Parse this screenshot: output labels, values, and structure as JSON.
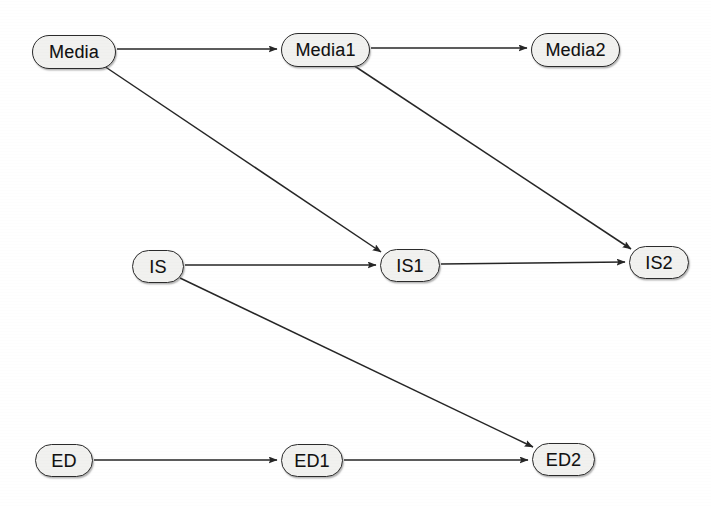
{
  "diagram": {
    "background_color": "#ffffff",
    "node_fill_color": "#f1f1ef",
    "node_stroke_color": "#2b2b2b",
    "edge_color": "#262626",
    "nodes": [
      {
        "id": "media",
        "label": "Media",
        "x": 32,
        "y": 35,
        "w": 84,
        "h": 34
      },
      {
        "id": "media1",
        "label": "Media1",
        "x": 281,
        "y": 33,
        "w": 89,
        "h": 34
      },
      {
        "id": "media2",
        "label": "Media2",
        "x": 531,
        "y": 33,
        "w": 89,
        "h": 34
      },
      {
        "id": "is",
        "label": "IS",
        "x": 132,
        "y": 250,
        "w": 52,
        "h": 33
      },
      {
        "id": "is1",
        "label": "IS1",
        "x": 380,
        "y": 249,
        "w": 60,
        "h": 33
      },
      {
        "id": "is2",
        "label": "IS2",
        "x": 629,
        "y": 246,
        "w": 60,
        "h": 33
      },
      {
        "id": "ed",
        "label": "ED",
        "x": 35,
        "y": 444,
        "w": 58,
        "h": 33
      },
      {
        "id": "ed1",
        "label": "ED1",
        "x": 281,
        "y": 444,
        "w": 62,
        "h": 33
      },
      {
        "id": "ed2",
        "label": "ED2",
        "x": 532,
        "y": 443,
        "w": 63,
        "h": 33
      }
    ],
    "edges": [
      {
        "id": "media-media1",
        "from": "Media",
        "to": "Media1",
        "type": "autoregressive",
        "x1": 117,
        "y1": 49,
        "x2": 277,
        "y2": 49
      },
      {
        "id": "media1-media2",
        "from": "Media1",
        "to": "Media2",
        "type": "autoregressive",
        "x1": 371,
        "y1": 48,
        "x2": 527,
        "y2": 48
      },
      {
        "id": "is-is1",
        "from": "IS",
        "to": "IS1",
        "type": "autoregressive",
        "x1": 185,
        "y1": 265,
        "x2": 376,
        "y2": 265
      },
      {
        "id": "is1-is2",
        "from": "IS1",
        "to": "IS2",
        "type": "autoregressive",
        "x1": 441,
        "y1": 264,
        "x2": 625,
        "y2": 262
      },
      {
        "id": "ed-ed1",
        "from": "ED",
        "to": "ED1",
        "type": "autoregressive",
        "x1": 94,
        "y1": 460,
        "x2": 277,
        "y2": 460
      },
      {
        "id": "ed1-ed2",
        "from": "ED1",
        "to": "ED2",
        "type": "autoregressive",
        "x1": 344,
        "y1": 460,
        "x2": 528,
        "y2": 460
      },
      {
        "id": "media-is1",
        "from": "Media",
        "to": "IS1",
        "type": "cross-lagged",
        "x1": 104,
        "y1": 66,
        "x2": 381,
        "y2": 252
      },
      {
        "id": "media1-is2",
        "from": "Media1",
        "to": "IS2",
        "type": "cross-lagged",
        "x1": 353,
        "y1": 65,
        "x2": 631,
        "y2": 249
      },
      {
        "id": "is-ed2",
        "from": "IS",
        "to": "ED2",
        "type": "cross-lagged",
        "x1": 180,
        "y1": 278,
        "x2": 533,
        "y2": 447
      }
    ]
  }
}
